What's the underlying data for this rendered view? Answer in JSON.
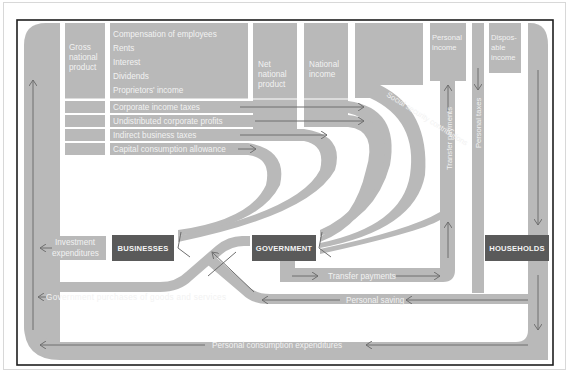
{
  "colors": {
    "flow_gray": "#b9b9b9",
    "box_dark": "#5a5a5a",
    "label_text": "#f2f2f2",
    "arrow_line": "#6e6e6e",
    "frame_border": "#1e1e1e",
    "background": "#ffffff"
  },
  "columns": {
    "gross_national_product": [
      "Gross",
      "national",
      "product"
    ],
    "income_components": [
      "Compensation of employees",
      "Rents",
      "Interest",
      "Dividends",
      "Proprietors' income"
    ],
    "net_national_product": [
      "Net",
      "national",
      "product"
    ],
    "national_income": [
      "National",
      "income"
    ],
    "personal_income": [
      "Personal",
      "income"
    ],
    "disposable_income": [
      "Dispos-",
      "able",
      "income"
    ]
  },
  "rows": [
    "Corporate income taxes",
    "Undistributed corporate profits",
    "Indirect business taxes",
    "Capital consumption allowance"
  ],
  "sectors": {
    "businesses": "BUSINESSES",
    "government": "GOVERNMENT",
    "households": "HOUSEHOLDS"
  },
  "flows": {
    "social_security": "Social security contributions",
    "transfer_payments_vertical": "Transfer payments",
    "personal_taxes": "Personal taxes",
    "investment": [
      "Investment",
      "expenditures"
    ],
    "transfer_payments": "Transfer payments",
    "government_purchases": "Government purchases of goods and services",
    "personal_saving": "Personal saving",
    "personal_consumption": "Personal consumption expenditures"
  }
}
